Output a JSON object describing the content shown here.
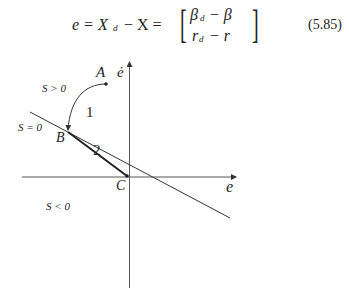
{
  "equation": {
    "lhs": "e = X",
    "lhs_sub": "d",
    "minus_x": "− X =",
    "matrix_row1": "β",
    "matrix_row1_sub": "d",
    "matrix_row1_rest": "− β",
    "matrix_row2": "r",
    "matrix_row2_sub": "d",
    "matrix_row2_rest": "− r",
    "number": "(5.85)"
  },
  "figure": {
    "y_axis_label": "ė",
    "x_axis_label": "e",
    "region_positive": "S > 0",
    "region_zero": "S = 0",
    "region_negative": "S < 0",
    "point_a": "A",
    "point_b": "B",
    "point_c": "C",
    "segment_1": "1",
    "segment_2": "2"
  }
}
